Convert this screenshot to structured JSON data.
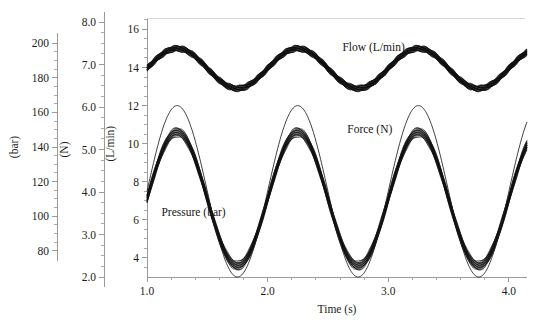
{
  "figure": {
    "background": "#ffffff",
    "ink_color": "#141414",
    "axis_color": "#9a9a9a"
  },
  "chart_data": {
    "type": "line",
    "title": "",
    "subtitle": "",
    "xlabel": "Time (s)",
    "ylabel": "",
    "grid": false,
    "legend_position": "inline-annotations",
    "x": {
      "label": "Time (s)",
      "min": 1.0,
      "max": 4.15,
      "ticks": [
        1.0,
        2.0,
        3.0,
        4.0
      ],
      "tick_labels": [
        "1.0",
        "2.0",
        "3.0",
        "4.0"
      ],
      "minor_tick_step": 0.2
    },
    "axes": [
      {
        "name": "pressure-axis",
        "unit_label": "(bar)",
        "min": 70,
        "max": 210,
        "ticks": [
          80,
          100,
          120,
          140,
          160,
          180,
          200
        ],
        "tick_labels": [
          "80",
          "100",
          "120",
          "140",
          "160",
          "180",
          "200"
        ],
        "minor_tick_step": 5,
        "position": "left-outer-1"
      },
      {
        "name": "force-axis",
        "unit_label": "(N)",
        "min": 2.0,
        "max": 8.0,
        "ticks": [
          2.0,
          3.0,
          4.0,
          5.0,
          6.0,
          7.0,
          8.0
        ],
        "tick_labels": [
          "2.0",
          "3.0",
          "4.0",
          "5.0",
          "6.0",
          "7.0",
          "8.0"
        ],
        "minor_tick_step": 0.25,
        "position": "left-outer-2"
      },
      {
        "name": "flow-axis",
        "unit_label": "(L/min)",
        "min": 3.0,
        "max": 16.6,
        "ticks": [
          4,
          6,
          8,
          10,
          12,
          14,
          16
        ],
        "tick_labels": [
          "4",
          "6",
          "8",
          "10",
          "12",
          "14",
          "16"
        ],
        "minor_tick_step": 0.5,
        "position": "left-inner-plot"
      }
    ],
    "series": [
      {
        "name": "Flow (L/min)",
        "annotation": "Flow (L/min)",
        "axis": "flow-axis",
        "style": "thick-noisy-band",
        "units": "L/min",
        "mean": 13.95,
        "amplitude": 1.05,
        "period_s": 1.0,
        "phase_peak_s": 1.25,
        "band_thickness": 0.28,
        "peak_value": 15.0,
        "trough_value": 12.9,
        "start_value": 13.2,
        "label_pos": {
          "x": 2.62,
          "y": 14.85
        }
      },
      {
        "name": "Force (N)",
        "annotation": "Force (N)",
        "axis": "force-axis",
        "style": "thin-line",
        "units": "N",
        "mean_in_flow_units": 7.5,
        "amplitude_in_flow_units": 4.5,
        "period_s": 1.0,
        "phase_peak_s": 1.25,
        "peak_value_N": 6.15,
        "trough_value_N": 2.2,
        "peak_value_flow_equiv": 12.0,
        "trough_value_flow_equiv": 3.0,
        "start_value_flow_equiv": 7.5,
        "label_pos": {
          "x": 2.66,
          "y": 10.55
        }
      },
      {
        "name": "Pressure (bar)",
        "annotation": "Pressure (bar)",
        "axis": "pressure-axis",
        "style": "thick-noisy-band",
        "units": "bar",
        "mean_in_flow_units": 7.1,
        "amplitude_in_flow_units": 3.5,
        "period_s": 1.0,
        "phase_peak_s": 1.25,
        "band_thickness": 0.45,
        "peak_value_bar": 163,
        "trough_value_bar": 88,
        "peak_value_flow_equiv": 10.6,
        "trough_value_flow_equiv": 3.6,
        "start_value_flow_equiv": 7.6,
        "label_pos": {
          "x": 1.12,
          "y": 6.2
        }
      }
    ]
  }
}
